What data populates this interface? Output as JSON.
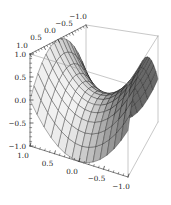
{
  "figure": {
    "kind": "3d-surface-plot",
    "style": "mathematica-grayscale",
    "background": "#ffffff",
    "title": ""
  },
  "chart_data": {
    "type": "surface3d",
    "title": "",
    "expression": "z = x² − y²",
    "expression_js": "x*x - y*y",
    "x_range": [
      -1,
      1
    ],
    "y_range": [
      -1,
      1
    ],
    "z_range": [
      -1,
      1
    ],
    "mesh_divisions": 14,
    "minor_tick_step": 0.1,
    "x_ticks": [
      {
        "v": 1,
        "label": "1.0"
      },
      {
        "v": 0.5,
        "label": "0.5"
      },
      {
        "v": 0,
        "label": "0.0"
      },
      {
        "v": -0.5,
        "label": "−0.5"
      },
      {
        "v": -1,
        "label": "−1.0"
      }
    ],
    "y_ticks": [
      {
        "v": 1,
        "label": "1.0"
      },
      {
        "v": 0.5,
        "label": "0.5"
      },
      {
        "v": 0,
        "label": "0.0"
      },
      {
        "v": -0.5,
        "label": "−0.5"
      },
      {
        "v": -1,
        "label": "−1.0"
      }
    ],
    "z_ticks": [
      {
        "v": 1,
        "label": "1.0"
      },
      {
        "v": 0.5,
        "label": "0.5"
      },
      {
        "v": 0,
        "label": "0.0"
      },
      {
        "v": -0.5,
        "label": "−0.5"
      },
      {
        "v": -1,
        "label": "−1.0"
      }
    ],
    "grid": true,
    "legend": null,
    "light_direction": [
      -0.6,
      0.55,
      0.58
    ],
    "colors": {
      "background": "#ffffff",
      "surface_dark": "#686868",
      "surface_light": "#f4f4f4",
      "mesh_line": "#161616",
      "box_edge": "#9a9a9a",
      "axis_line": "#2a2a2a",
      "tick": "#2a2a2a",
      "label": "#1a1a1a"
    },
    "label_font_size": 7.2
  }
}
